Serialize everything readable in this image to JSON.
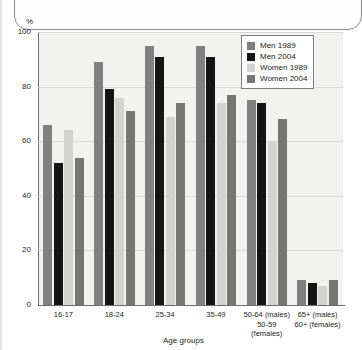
{
  "chart_data": {
    "type": "bar",
    "title": "",
    "xlabel": "Age groups",
    "ylabel": "%",
    "ylim": [
      0,
      100
    ],
    "yticks": [
      0,
      20,
      40,
      60,
      80,
      100
    ],
    "grid": true,
    "legend_position": "top-right",
    "categories": [
      "16-17",
      "18-24",
      "25-34",
      "35-49",
      "50-64 (males)\n50-59 (females)",
      "65+ (males)\n60+ (females)"
    ],
    "category_lines": [
      [
        "16-17"
      ],
      [
        "18-24"
      ],
      [
        "25-34"
      ],
      [
        "35-49"
      ],
      [
        "50-64 (males)",
        "50-59",
        "(females)"
      ],
      [
        "65+ (males)",
        "60+ (females)"
      ]
    ],
    "series": [
      {
        "name": "Men 1989",
        "color": "#808080",
        "values": [
          66,
          89,
          95,
          95,
          75,
          9
        ]
      },
      {
        "name": "Men 2004",
        "color": "#151515",
        "values": [
          52,
          79,
          91,
          91,
          74,
          8
        ]
      },
      {
        "name": "Women 1989",
        "color": "#d2d2d0",
        "values": [
          64,
          76,
          69,
          74,
          60,
          7
        ]
      },
      {
        "name": "Women 2004",
        "color": "#767674",
        "values": [
          54,
          71,
          74,
          77,
          68,
          9
        ]
      }
    ]
  },
  "axis": {
    "y_unit": "%",
    "y_tick_labels": [
      "100",
      "80",
      "60",
      "40",
      "20",
      "0"
    ],
    "x_title": "Age groups"
  },
  "legend": {
    "entries": [
      {
        "label": "Men 1989"
      },
      {
        "label": "Men 2004"
      },
      {
        "label": "Women 1989"
      },
      {
        "label": "Women 2004"
      }
    ]
  },
  "colors": {
    "men_1989": "#808080",
    "men_2004": "#151515",
    "women_1989": "#d2d2d0",
    "women_2004": "#767674",
    "plot_background": "#f2f2f0",
    "axis": "#6e6e6e",
    "gridline": "#d8d8d6"
  }
}
